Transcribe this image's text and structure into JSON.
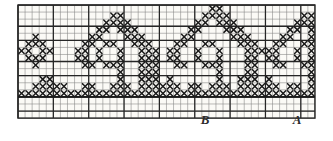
{
  "document": {
    "kind": "cross-stitch-chart",
    "title": "Cross-stitch border chart",
    "paper_color": "#fbfaf6",
    "ink_color": "#1a1a1a",
    "grid_line_color": "#6e6e6e",
    "grid_major_color": "#262626",
    "stitch_symbol": "x"
  },
  "grid": {
    "origin_x": 18,
    "origin_y": 5,
    "cell": 7.07,
    "cols": 42,
    "rows": 16,
    "major_every": 5,
    "baseline_row": 13,
    "top_rule_row": 3,
    "mid_rule_row": 8
  },
  "labels": [
    {
      "text": "B",
      "x": 205,
      "y": 124,
      "name": "chart-label-b"
    },
    {
      "text": "A",
      "x": 297,
      "y": 124,
      "name": "chart-label-a"
    }
  ],
  "chart_data": {
    "type": "heatmap",
    "xlabel": "",
    "ylabel": "",
    "grid": true,
    "legend": "none",
    "cols": 42,
    "rows": 16,
    "cell_px": 7.07,
    "symbol": "x",
    "repeat_period_cols": 14,
    "motif_count": 3,
    "stitches": [
      {
        "row": 0,
        "cols": [
          27,
          28
        ]
      },
      {
        "row": 1,
        "cols": [
          13,
          14,
          26,
          27,
          28,
          29,
          40,
          41
        ]
      },
      {
        "row": 2,
        "cols": [
          12,
          13,
          14,
          15,
          25,
          26,
          28,
          29,
          30,
          39,
          40,
          41
        ]
      },
      {
        "row": 3,
        "cols": [
          11,
          12,
          14,
          15,
          16,
          24,
          25,
          29,
          30,
          31,
          38,
          39,
          41
        ]
      },
      {
        "row": 4,
        "cols": [
          2,
          10,
          11,
          15,
          16,
          17,
          23,
          24,
          30,
          31,
          32,
          37,
          38,
          41
        ]
      },
      {
        "row": 5,
        "cols": [
          1,
          2,
          3,
          9,
          10,
          12,
          13,
          16,
          17,
          18,
          22,
          23,
          26,
          27,
          31,
          32,
          33,
          36,
          37,
          40,
          41
        ]
      },
      {
        "row": 6,
        "cols": [
          0,
          1,
          3,
          4,
          8,
          9,
          11,
          14,
          17,
          18,
          19,
          21,
          22,
          25,
          28,
          32,
          33,
          34,
          35,
          36,
          39,
          41
        ]
      },
      {
        "row": 7,
        "cols": [
          1,
          2,
          3,
          8,
          9,
          11,
          14,
          17,
          18,
          19,
          21,
          22,
          25,
          28,
          32,
          33,
          35,
          36,
          39,
          41
        ]
      },
      {
        "row": 8,
        "cols": [
          2,
          9,
          10,
          12,
          13,
          14,
          17,
          18,
          19,
          22,
          23,
          26,
          27,
          28,
          32,
          33,
          36,
          37,
          40,
          41
        ]
      },
      {
        "row": 9,
        "cols": [
          14,
          17,
          18,
          19,
          28,
          32,
          33,
          41
        ]
      },
      {
        "row": 10,
        "cols": [
          3,
          4,
          14,
          17,
          18,
          19,
          21,
          28,
          31,
          32,
          33,
          35,
          41
        ]
      },
      {
        "row": 11,
        "cols": [
          2,
          3,
          4,
          5,
          6,
          9,
          10,
          13,
          14,
          15,
          17,
          18,
          19,
          20,
          21,
          22,
          24,
          25,
          27,
          28,
          29,
          31,
          32,
          33,
          34,
          35,
          36,
          38,
          39,
          41
        ]
      },
      {
        "row": 12,
        "cols": [
          0,
          1,
          2,
          3,
          4,
          5,
          6,
          7,
          8,
          9,
          10,
          11,
          12,
          13,
          14,
          15,
          16,
          17,
          18,
          19,
          20,
          21,
          22,
          23,
          24,
          25,
          26,
          27,
          28,
          29,
          30,
          31,
          32,
          33,
          34,
          35,
          36,
          37,
          38,
          39,
          40,
          41
        ]
      }
    ]
  }
}
